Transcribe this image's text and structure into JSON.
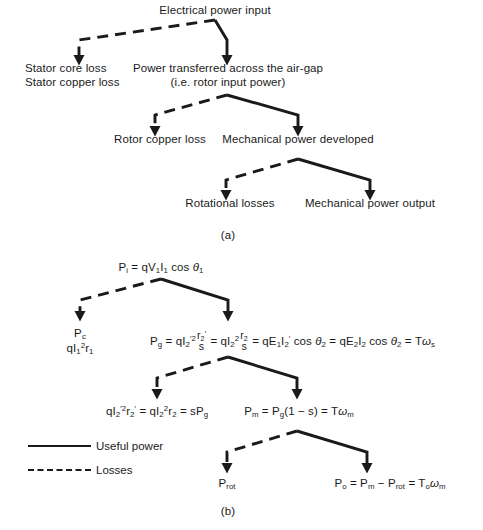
{
  "figure": {
    "colors": {
      "ink": "#1a1a1a",
      "background": "#ffffff"
    },
    "panel_a": {
      "caption": "(a)",
      "nodes": {
        "input": "Electrical power input",
        "stator_loss_line1": "Stator core loss",
        "stator_loss_line2": "Stator copper loss",
        "airgap_line1": "Power transferred across the air-gap",
        "airgap_line2": "(i.e. rotor input power)",
        "rotor_copper_loss": "Rotor copper loss",
        "mech_power_developed": "Mechanical power developed",
        "rotational_losses": "Rotational losses",
        "mech_power_output": "Mechanical power output"
      },
      "branches": [
        {
          "from": "input",
          "loss_to": "stator_loss",
          "useful_to": "airgap"
        },
        {
          "from": "airgap",
          "loss_to": "rotor_copper_loss",
          "useful_to": "mech_power_developed"
        },
        {
          "from": "mech_power_developed",
          "loss_to": "rotational_losses",
          "useful_to": "mech_power_output"
        }
      ]
    },
    "panel_b": {
      "caption": "(b)",
      "equations": {
        "input": "P_i = qV_1 I_1 cos θ_1",
        "stator_loss_line1": "P_c",
        "stator_loss_line2": "qI_1^2 r_1",
        "airgap": "P_g = qI'^2_2 (r'_2/s) = qI^2_2 (r_2/s) = qE_1 I'_2 cos θ_2 = qE_2 I_2 cos θ_2 = Tω_s",
        "rotor_copper_loss": "qI'^2_2 r'_2 = qI^2_2 r_2 = sP_g",
        "mech_power_developed": "P_m = P_g(1 - s) = Tω_m",
        "rotational_losses": "P_rot",
        "mech_power_output": "P_o = P_m - P_rot = T_o ω_m"
      },
      "legend": [
        {
          "style": "solid",
          "label": "Useful power"
        },
        {
          "style": "dashed",
          "label": "Losses"
        }
      ]
    }
  }
}
